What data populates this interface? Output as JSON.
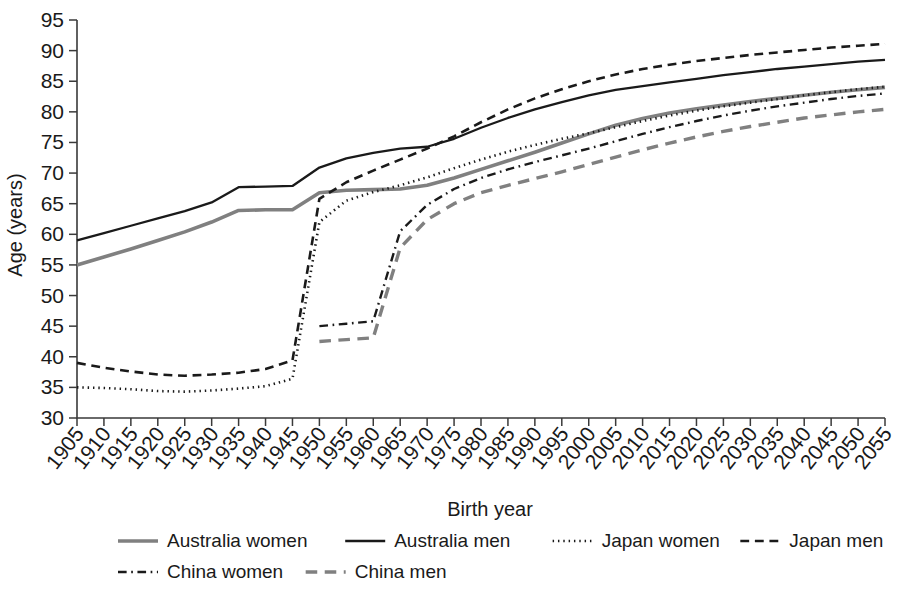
{
  "chart_data": {
    "type": "line",
    "title": "",
    "xlabel": "Birth year",
    "ylabel": "Age (years)",
    "xlim": [
      1905,
      2055
    ],
    "ylim": [
      30,
      95
    ],
    "grid": false,
    "legend_position": "bottom",
    "x_ticks": [
      1905,
      1910,
      1915,
      1920,
      1925,
      1930,
      1935,
      1940,
      1945,
      1950,
      1955,
      1960,
      1965,
      1970,
      1975,
      1980,
      1985,
      1990,
      1995,
      2000,
      2005,
      2010,
      2015,
      2020,
      2025,
      2030,
      2035,
      2040,
      2045,
      2050,
      2055
    ],
    "y_ticks": [
      30,
      35,
      40,
      45,
      50,
      55,
      60,
      65,
      70,
      75,
      80,
      85,
      90,
      95
    ],
    "series": [
      {
        "name": "Australia women",
        "color": "#808080",
        "dash": "solid",
        "width": 3.6,
        "x": [
          1905,
          1910,
          1915,
          1920,
          1925,
          1930,
          1935,
          1940,
          1945,
          1950,
          1955,
          1960,
          1965,
          1970,
          1975,
          1980,
          1985,
          1990,
          1995,
          2000,
          2005,
          2010,
          2015,
          2020,
          2025,
          2030,
          2035,
          2040,
          2045,
          2050,
          2055
        ],
        "values": [
          55.0,
          56.3,
          57.6,
          59.0,
          60.4,
          62.0,
          63.9,
          64.0,
          64.0,
          66.8,
          67.2,
          67.3,
          67.4,
          68.0,
          69.2,
          70.6,
          72.0,
          73.4,
          74.9,
          76.4,
          77.8,
          78.9,
          79.8,
          80.5,
          81.1,
          81.7,
          82.2,
          82.7,
          83.2,
          83.6,
          84.0
        ]
      },
      {
        "name": "Australia men",
        "color": "#1a1a1a",
        "dash": "solid",
        "width": 2.3,
        "x": [
          1905,
          1910,
          1915,
          1920,
          1925,
          1930,
          1935,
          1940,
          1945,
          1950,
          1955,
          1960,
          1965,
          1970,
          1975,
          1980,
          1985,
          1990,
          1995,
          2000,
          2005,
          2010,
          2015,
          2020,
          2025,
          2030,
          2035,
          2040,
          2045,
          2050,
          2055
        ],
        "values": [
          59.0,
          60.2,
          61.4,
          62.6,
          63.8,
          65.2,
          67.7,
          67.8,
          67.9,
          70.9,
          72.4,
          73.3,
          74.0,
          74.3,
          75.6,
          77.4,
          79.0,
          80.4,
          81.6,
          82.7,
          83.6,
          84.2,
          84.8,
          85.4,
          86.0,
          86.5,
          87.0,
          87.4,
          87.8,
          88.2,
          88.5
        ]
      },
      {
        "name": "Japan women",
        "color": "#1a1a1a",
        "dash": "dotted",
        "width": 2.6,
        "x": [
          1905,
          1910,
          1915,
          1920,
          1925,
          1930,
          1935,
          1940,
          1945,
          1950,
          1955,
          1960,
          1965,
          1970,
          1975,
          1980,
          1985,
          1990,
          1995,
          2000,
          2005,
          2010,
          2015,
          2020,
          2025,
          2030,
          2035,
          2040,
          2045,
          2050,
          2055
        ],
        "values": [
          35.0,
          34.9,
          34.7,
          34.4,
          34.3,
          34.5,
          34.8,
          35.2,
          36.4,
          62.0,
          65.5,
          66.9,
          68.0,
          69.3,
          70.8,
          72.2,
          73.5,
          74.6,
          75.6,
          76.5,
          77.5,
          78.5,
          79.4,
          80.2,
          80.9,
          81.5,
          82.1,
          82.7,
          83.2,
          83.7,
          84.1
        ]
      },
      {
        "name": "Japan men",
        "color": "#1a1a1a",
        "dash": "dashed",
        "width": 2.6,
        "x": [
          1905,
          1910,
          1915,
          1920,
          1925,
          1930,
          1935,
          1940,
          1945,
          1950,
          1955,
          1960,
          1965,
          1970,
          1975,
          1980,
          1985,
          1990,
          1995,
          2000,
          2005,
          2010,
          2015,
          2020,
          2025,
          2030,
          2035,
          2040,
          2045,
          2050,
          2055
        ],
        "values": [
          39.0,
          38.2,
          37.6,
          37.1,
          36.9,
          37.1,
          37.4,
          38.0,
          39.4,
          65.8,
          68.5,
          70.4,
          72.2,
          74.0,
          76.0,
          78.3,
          80.4,
          82.2,
          83.7,
          85.0,
          86.1,
          87.0,
          87.7,
          88.3,
          88.8,
          89.3,
          89.7,
          90.1,
          90.5,
          90.8,
          91.1
        ]
      },
      {
        "name": "China women",
        "color": "#1a1a1a",
        "dash": "dashdot",
        "width": 2.4,
        "x": [
          1950,
          1955,
          1960,
          1965,
          1970,
          1975,
          1980,
          1985,
          1990,
          1995,
          2000,
          2005,
          2010,
          2015,
          2020,
          2025,
          2030,
          2035,
          2040,
          2045,
          2050,
          2055
        ],
        "values": [
          45.0,
          45.4,
          45.8,
          60.5,
          64.8,
          67.4,
          69.2,
          70.6,
          71.8,
          72.9,
          74.0,
          75.2,
          76.4,
          77.5,
          78.5,
          79.4,
          80.2,
          80.9,
          81.5,
          82.1,
          82.6,
          83.0
        ]
      },
      {
        "name": "China men",
        "color": "#808080",
        "dash": "dashed",
        "width": 3.4,
        "x": [
          1950,
          1955,
          1960,
          1965,
          1970,
          1975,
          1980,
          1985,
          1990,
          1995,
          2000,
          2005,
          2010,
          2015,
          2020,
          2025,
          2030,
          2035,
          2040,
          2045,
          2050,
          2055
        ],
        "values": [
          42.5,
          42.8,
          43.1,
          57.8,
          62.4,
          65.0,
          66.8,
          68.0,
          69.1,
          70.2,
          71.4,
          72.6,
          73.8,
          74.9,
          75.9,
          76.8,
          77.6,
          78.3,
          79.0,
          79.5,
          80.0,
          80.4
        ]
      }
    ]
  },
  "legend": {
    "rows": [
      [
        {
          "label": "Australia women",
          "series": 0
        },
        {
          "label": "Australia men",
          "series": 1
        },
        {
          "label": "Japan women",
          "series": 2
        },
        {
          "label": "Japan men",
          "series": 3
        }
      ],
      [
        {
          "label": "China women",
          "series": 4
        },
        {
          "label": "China men",
          "series": 5
        }
      ]
    ]
  }
}
